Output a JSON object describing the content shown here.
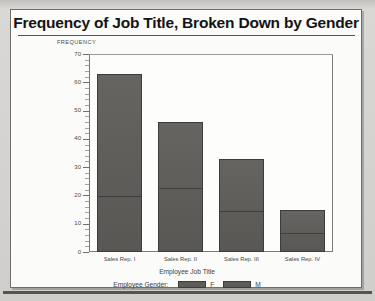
{
  "document": {
    "title": "Frequency of Job Title, Broken Down by Gender"
  },
  "chart_data": {
    "type": "bar",
    "subtype": "stacked-vertical",
    "title": "Frequency of Job Title, Broken Down by Gender",
    "xlabel": "Employee Job Title",
    "ylabel": "FREQUENCY",
    "ylim": [
      0,
      70
    ],
    "yticks": [
      0,
      10,
      20,
      30,
      40,
      50,
      60,
      70
    ],
    "ytick_labels": [
      "0",
      "10",
      "20",
      "30",
      "40",
      "50",
      "60",
      "70"
    ],
    "grid": false,
    "legend_title": "Employee Gender:",
    "legend_position": "bottom",
    "categories": [
      "Sales Rep. I",
      "Sales Rep. II",
      "Sales Rep. III",
      "Sales Rep. IV"
    ],
    "series": [
      {
        "name": "F",
        "color": "#5d5c59",
        "values": [
          20,
          23,
          15,
          7
        ]
      },
      {
        "name": "M",
        "color": "#5d5c59",
        "values": [
          43,
          23,
          18,
          8
        ]
      }
    ],
    "totals": [
      63,
      46,
      33,
      15
    ]
  },
  "colors": {
    "bar_fill": "#5d5c59",
    "bar_edge": "#3d3c3a",
    "axis": "#7b7a76",
    "paper": "#fbfbf9",
    "backdrop": "#c2c1bd"
  }
}
